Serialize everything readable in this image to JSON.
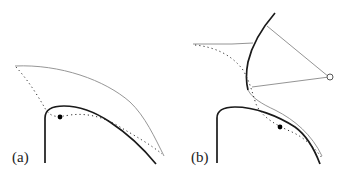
{
  "figure": {
    "panels": [
      {
        "id": "a",
        "label": "(a)",
        "elements": [
          "wall (thick solid line)",
          "outer boundary (thin solid line)",
          "dotted path",
          "solid dot marker"
        ]
      },
      {
        "id": "b",
        "label": "(b)",
        "elements": [
          "wall (thick solid line)",
          "curved arc (thick solid line)",
          "outer boundary (thin solid line)",
          "dotted path",
          "solid dot marker",
          "open circle pivot",
          "two thin rays from pivot"
        ]
      }
    ],
    "colors": {
      "thick_line": "#1a1a1a",
      "thin_line": "#777777",
      "dotted_line": "#333333",
      "marker_fill": "#000000",
      "open_marker_stroke": "#555555",
      "background": "#ffffff"
    }
  }
}
